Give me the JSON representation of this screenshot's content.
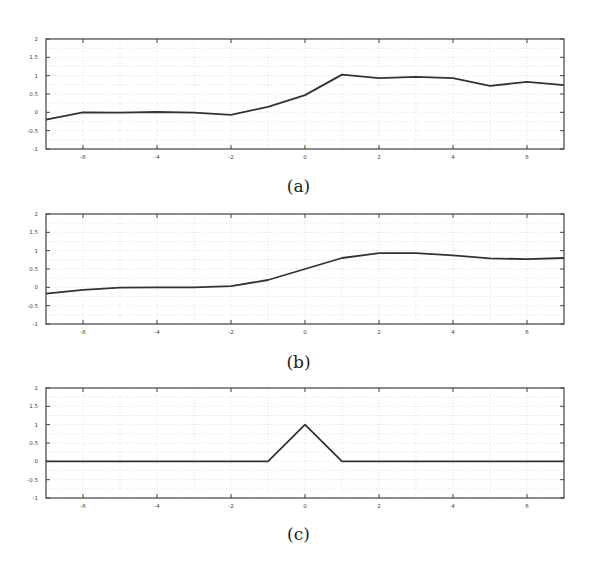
{
  "chart_data": [
    {
      "id": "a",
      "type": "line",
      "caption": "(a)",
      "xlim": [
        -7,
        7
      ],
      "ylim": [
        -1,
        2
      ],
      "xticks": [
        -6,
        -4,
        -2,
        0,
        2,
        4,
        6
      ],
      "yticks": [
        -1,
        -0.5,
        0,
        0.5,
        1,
        1.5,
        2
      ],
      "xtick_labels": [
        "-6",
        "-4",
        "-2",
        "0",
        "2",
        "4",
        "6"
      ],
      "ytick_labels": [
        "-1",
        "-0.5",
        "0",
        "0.5",
        "1",
        "1.5",
        "2"
      ],
      "grid": true,
      "x": [
        -7,
        -6,
        -5,
        -4,
        -3,
        -2,
        -1,
        0,
        1,
        2,
        3,
        4,
        5,
        6,
        7
      ],
      "values": [
        -0.2,
        0.0,
        -0.01,
        0.01,
        -0.01,
        -0.07,
        0.15,
        0.47,
        1.03,
        0.93,
        0.97,
        0.93,
        0.72,
        0.83,
        0.74
      ]
    },
    {
      "id": "b",
      "type": "line",
      "caption": "(b)",
      "xlim": [
        -7,
        7
      ],
      "ylim": [
        -1,
        2
      ],
      "xticks": [
        -6,
        -4,
        -2,
        0,
        2,
        4,
        6
      ],
      "yticks": [
        -1,
        -0.5,
        0,
        0.5,
        1,
        1.5,
        2
      ],
      "xtick_labels": [
        "-6",
        "-4",
        "-2",
        "0",
        "2",
        "4",
        "6"
      ],
      "ytick_labels": [
        "-1",
        "-0.5",
        "0",
        "0.5",
        "1",
        "1.5",
        "2"
      ],
      "grid": true,
      "x": [
        -7,
        -6,
        -5,
        -4,
        -3,
        -2,
        -1,
        0,
        1,
        2,
        3,
        4,
        5,
        6,
        7
      ],
      "values": [
        -0.17,
        -0.07,
        -0.01,
        0.0,
        0.0,
        0.03,
        0.2,
        0.5,
        0.8,
        0.93,
        0.93,
        0.87,
        0.79,
        0.77,
        0.8
      ]
    },
    {
      "id": "c",
      "type": "line",
      "caption": "(c)",
      "xlim": [
        -7,
        7
      ],
      "ylim": [
        -1,
        2
      ],
      "xticks": [
        -6,
        -4,
        -2,
        0,
        2,
        4,
        6
      ],
      "yticks": [
        -1,
        -0.5,
        0,
        0.5,
        1,
        1.5,
        2
      ],
      "xtick_labels": [
        "-6",
        "-4",
        "-2",
        "0",
        "2",
        "4",
        "6"
      ],
      "ytick_labels": [
        "-1",
        "-0.5",
        "0",
        "0.5",
        "1",
        "1.5",
        "2"
      ],
      "grid": true,
      "x": [
        -7,
        -1,
        0,
        1,
        7
      ],
      "values": [
        0,
        0,
        1,
        0,
        0
      ]
    }
  ],
  "layout": {
    "plots": [
      {
        "top": 39,
        "caption_top": 176
      },
      {
        "top": 214,
        "caption_top": 352
      },
      {
        "top": 388,
        "caption_top": 524
      }
    ],
    "plot_left": 46,
    "plot_width": 518,
    "plot_height": 110,
    "line_color": "#333333",
    "grid_color": "#cfcfcf",
    "frame_color": "#444444"
  }
}
